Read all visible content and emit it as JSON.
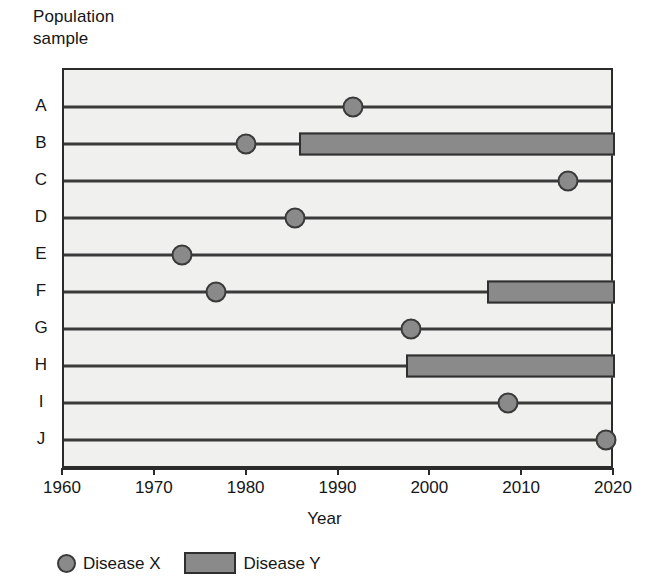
{
  "chart_data": {
    "type": "table",
    "chart_style": "timeline-gantt",
    "title": "",
    "ylabel": "Population\nsample",
    "xlabel": "Year",
    "xlim": [
      1960,
      2020
    ],
    "xticks": [
      1960,
      1970,
      1980,
      1990,
      2000,
      2010,
      2020
    ],
    "xtick_labels": [
      "1960",
      "1970",
      "1980",
      "1990",
      "2000",
      "2010",
      "2020"
    ],
    "categories": [
      "A",
      "B",
      "C",
      "D",
      "E",
      "F",
      "G",
      "H",
      "I",
      "J"
    ],
    "grid": false,
    "legend_position": "below-axis-left",
    "legend": [
      {
        "marker": "circle",
        "label": "Disease X"
      },
      {
        "marker": "rectangle",
        "label": "Disease Y"
      }
    ],
    "series": [
      {
        "name": "Disease X",
        "marker": "circle",
        "points": [
          {
            "category": "A",
            "year": 1991.5
          },
          {
            "category": "B",
            "year": 1979.8
          },
          {
            "category": "C",
            "year": 2014.9
          },
          {
            "category": "D",
            "year": 1985.2
          },
          {
            "category": "E",
            "year": 1972.8
          },
          {
            "category": "F",
            "year": 1976.5
          },
          {
            "category": "G",
            "year": 1997.8
          },
          {
            "category": "I",
            "year": 2008.3
          },
          {
            "category": "J",
            "year": 2019.0
          }
        ]
      },
      {
        "name": "Disease Y",
        "marker": "rectangle",
        "spans": [
          {
            "category": "B",
            "start": 1985.6,
            "end": 2020
          },
          {
            "category": "F",
            "start": 2006.1,
            "end": 2020
          },
          {
            "category": "H",
            "start": 1997.2,
            "end": 2020
          }
        ]
      }
    ]
  },
  "colors": {
    "marker_fill": "#8a8a8a",
    "marker_edge": "#3a3a3a",
    "plot_background": "#f0f0ee",
    "axis": "#2b2b2b",
    "text": "#161616"
  }
}
